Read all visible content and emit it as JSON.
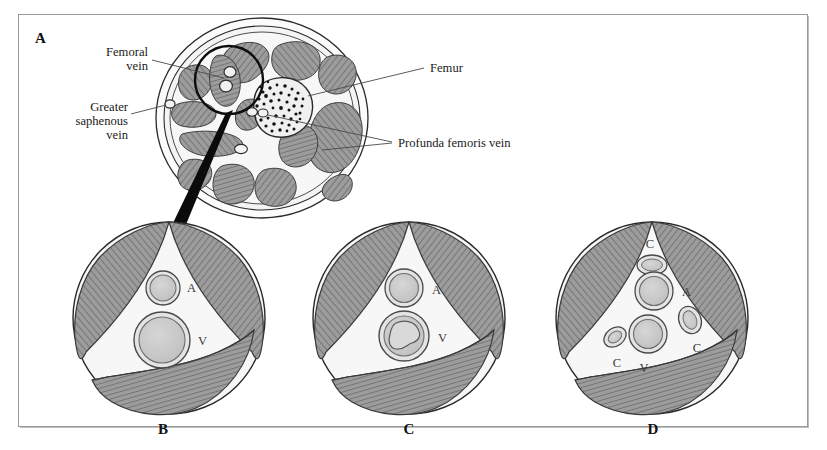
{
  "figure": {
    "background_color": "#ffffff",
    "frame_color": "#9a9a9a",
    "muscle_fill": "#9c9c9c",
    "muscle_hatch": "#5e5e5e",
    "fascia_fill": "#f2f2f2",
    "vessel_wall": "#8f8f8f",
    "vessel_lumen": "#c9c9c9",
    "bone_stipple": "#1a1a1a"
  },
  "panels": [
    {
      "id": "A",
      "letter": "A",
      "caption_position": "top-left",
      "description": "Axial cross-section of the thigh showing muscle compartments, femur and femoral vessels",
      "labels": [
        {
          "id": "femoral-vein",
          "text": "Femoral vein",
          "lines": [
            "Femoral",
            "vein"
          ],
          "side": "left"
        },
        {
          "id": "greater-saphenous-vein",
          "text": "Greater saphenous vein",
          "lines": [
            "Greater",
            "saphenous",
            "vein"
          ],
          "side": "left"
        },
        {
          "id": "femur",
          "text": "Femur",
          "lines": [
            "Femur"
          ],
          "side": "right"
        },
        {
          "id": "profunda-femoris-vein",
          "text": "Profunda femoris vein",
          "lines": [
            "Profunda femoris vein"
          ],
          "side": "right"
        }
      ]
    },
    {
      "id": "B",
      "letter": "B",
      "caption_position": "bottom",
      "description": "Normal femoral artery and vein within the femoral sheath",
      "vessels": [
        {
          "id": "artery",
          "letter": "A",
          "name": "femoral artery",
          "state": "patent"
        },
        {
          "id": "vein",
          "letter": "V",
          "name": "femoral vein",
          "state": "patent"
        }
      ]
    },
    {
      "id": "C",
      "letter": "C",
      "caption_position": "bottom",
      "description": "Femoral vein containing an acute thrombus",
      "vessels": [
        {
          "id": "artery",
          "letter": "A",
          "name": "femoral artery",
          "state": "patent"
        },
        {
          "id": "vein",
          "letter": "V",
          "name": "femoral vein",
          "state": "thrombosed"
        }
      ]
    },
    {
      "id": "D",
      "letter": "D",
      "caption_position": "bottom",
      "description": "Recanalized vein with surrounding collateral veins",
      "vessels": [
        {
          "id": "artery",
          "letter": "A",
          "name": "femoral artery",
          "state": "patent"
        },
        {
          "id": "vein",
          "letter": "V",
          "name": "femoral vein",
          "state": "recanalized"
        },
        {
          "id": "collateral-top",
          "letter": "C",
          "name": "collateral vein",
          "state": "collateral"
        },
        {
          "id": "collateral-right",
          "letter": "C",
          "name": "collateral vein",
          "state": "collateral"
        },
        {
          "id": "collateral-left",
          "letter": "C",
          "name": "collateral vein",
          "state": "collateral"
        }
      ]
    }
  ]
}
